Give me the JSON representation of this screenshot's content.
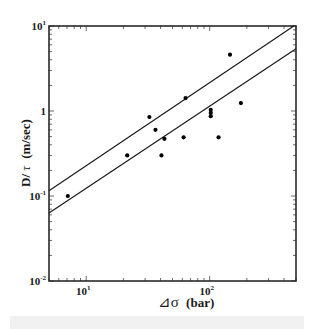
{
  "chart_data": {
    "type": "scatter",
    "title": "",
    "xlabel": "⊿σ (bar)",
    "ylabel": "D/τ (m/sec)",
    "xscale": "log",
    "yscale": "log",
    "xlim": [
      5,
      500
    ],
    "ylim": [
      0.01,
      10
    ],
    "grid": false,
    "legend": null,
    "x_ticks": [
      {
        "value": 10,
        "label": "10",
        "exp": "1"
      },
      {
        "value": 100,
        "label": "10",
        "exp": "2"
      }
    ],
    "y_ticks": [
      {
        "value": 10,
        "label": "10",
        "exp": "1"
      },
      {
        "value": 1,
        "label": "1",
        "exp": ""
      },
      {
        "value": 0.1,
        "label": "10",
        "exp": "-1"
      },
      {
        "value": 0.01,
        "label": "10",
        "exp": "-2"
      }
    ],
    "series": [
      {
        "name": "observations",
        "kind": "scatter",
        "points": [
          [
            7.1,
            0.1
          ],
          [
            21.5,
            0.3
          ],
          [
            32.5,
            0.85
          ],
          [
            36.4,
            0.6
          ],
          [
            40.7,
            0.3
          ],
          [
            43,
            0.47
          ],
          [
            61.5,
            0.49
          ],
          [
            63.8,
            1.42
          ],
          [
            102,
            1.03
          ],
          [
            102,
            0.95
          ],
          [
            102,
            0.87
          ],
          [
            118,
            0.49
          ],
          [
            146,
            4.6
          ],
          [
            179,
            1.24
          ]
        ]
      },
      {
        "name": "upper bound line",
        "kind": "line",
        "points": [
          [
            5,
            0.115
          ],
          [
            480,
            10
          ]
        ]
      },
      {
        "name": "lower bound line",
        "kind": "line",
        "points": [
          [
            5,
            0.063
          ],
          [
            500,
            5.4
          ]
        ]
      }
    ]
  },
  "axes": {
    "x_title_symbol": "⊿σ",
    "x_title_unit": "(bar)",
    "y_title_main": "D/",
    "y_title_symbol": "τ",
    "y_title_unit": "(m/sec)"
  },
  "colors": {
    "axis": "#2a2a2a",
    "points": "#000000",
    "lines": "#1a1a1a",
    "background": "#ffffff"
  }
}
